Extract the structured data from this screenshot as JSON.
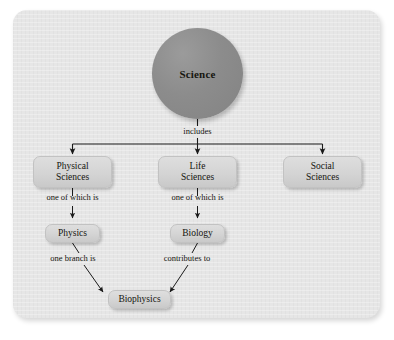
{
  "diagram": {
    "colors": {
      "canvas": "#ffffff",
      "card": "#e6e6e6",
      "root_fill": "#8c8c8c",
      "node_fill": "#d4d4d4",
      "node_border": "#c2c2c2",
      "text": "#14140e",
      "connector": "#1a1a1a"
    },
    "root": {
      "label": "Science"
    },
    "nodes": [
      {
        "id": "physical-sciences",
        "label": "Physical\nSciences",
        "line1": "Physical",
        "line2": "Sciences"
      },
      {
        "id": "life-sciences",
        "label": "Life\nSciences",
        "line1": "Life",
        "line2": "Sciences"
      },
      {
        "id": "social-sciences",
        "label": "Social\nSciences",
        "line1": "Social",
        "line2": "Sciences"
      },
      {
        "id": "physics",
        "label": "Physics"
      },
      {
        "id": "biology",
        "label": "Biology"
      },
      {
        "id": "biophysics",
        "label": "Biophysics"
      }
    ],
    "edge_labels": {
      "includes": "includes",
      "physical_to_physics": "one of which is",
      "life_to_biology": "one of which is",
      "physics_to_biophysics": "one branch is",
      "biology_to_biophysics": "contributes to"
    }
  }
}
